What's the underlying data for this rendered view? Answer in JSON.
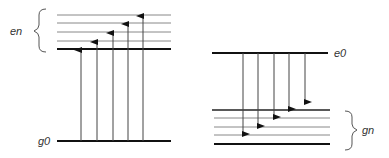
{
  "left_diagram": {
    "title": "absorption",
    "ground_label": "g0",
    "excited_group_label": "en",
    "ground_level_y": 141,
    "excited_levels_y": [
      49,
      41,
      32,
      23,
      15
    ],
    "arrows_x": [
      81,
      97,
      113,
      128,
      143
    ],
    "arrow_targets_y": [
      49,
      41,
      32,
      23,
      15
    ]
  },
  "right_diagram": {
    "title": "emission",
    "excited_label": "e0",
    "ground_group_label": "gn",
    "excited_level_y": 53,
    "ground_levels_y": [
      110,
      118,
      127,
      135,
      144
    ],
    "arrows_x": [
      243,
      258,
      274,
      289,
      305
    ],
    "arrow_targets_y": [
      135,
      127,
      118,
      110,
      102
    ]
  },
  "colors": {
    "line": "#111111",
    "thin_line": "#777777",
    "arrow": "#222222",
    "text": "#333333"
  }
}
